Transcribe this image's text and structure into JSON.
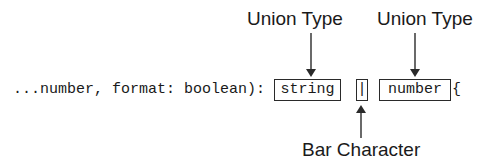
{
  "labels": {
    "union_type_1": "Union Type",
    "union_type_2": "Union Type",
    "bar_character": "Bar Character"
  },
  "code": {
    "prefix": "...number, format: boolean):",
    "type_1": "string",
    "bar": "|",
    "type_2": "number",
    "suffix": "{"
  },
  "colors": {
    "text": "#1a1a1a",
    "background": "#ffffff",
    "lines": "#2a2a2a"
  }
}
